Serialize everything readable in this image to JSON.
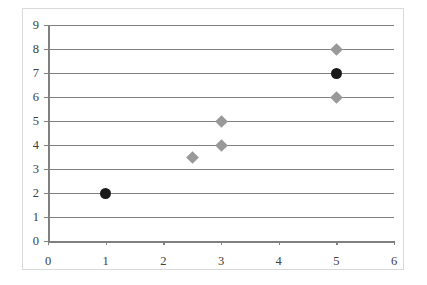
{
  "chart_data": {
    "type": "scatter",
    "title": "",
    "subtitle": "",
    "xlabel": "",
    "ylabel": "",
    "xlim": [
      0,
      6
    ],
    "ylim": [
      0,
      9
    ],
    "x_ticks": [
      0,
      1,
      2,
      3,
      4,
      5,
      6
    ],
    "y_ticks": [
      0,
      1,
      2,
      3,
      4,
      5,
      6,
      7,
      8,
      9
    ],
    "x_tick_labels": [
      "0",
      "1",
      "2",
      "3",
      "4",
      "5",
      "6"
    ],
    "y_tick_labels": [
      "0",
      "1",
      "2",
      "3",
      "4",
      "5",
      "6",
      "7",
      "8",
      "9"
    ],
    "grid": {
      "horizontal": true,
      "vertical": false,
      "color": "#808080"
    },
    "legend": {
      "visible": false,
      "position": "none",
      "entries": []
    },
    "annotations": [],
    "series": [
      {
        "name": "black-circles",
        "marker": "circle",
        "color": "#1a1a1a",
        "size": 11,
        "points": [
          {
            "x": 1,
            "y": 2
          },
          {
            "x": 5,
            "y": 7
          }
        ]
      },
      {
        "name": "gray-diamonds",
        "marker": "diamond",
        "color": "#999999",
        "size": 9,
        "points": [
          {
            "x": 2.5,
            "y": 3.5
          },
          {
            "x": 3,
            "y": 4
          },
          {
            "x": 3,
            "y": 5
          },
          {
            "x": 5,
            "y": 6
          },
          {
            "x": 5,
            "y": 8
          }
        ]
      }
    ]
  },
  "geometry": {
    "plot_left": 48,
    "plot_right": 394,
    "plot_bottom": 241,
    "plot_top": 25
  }
}
